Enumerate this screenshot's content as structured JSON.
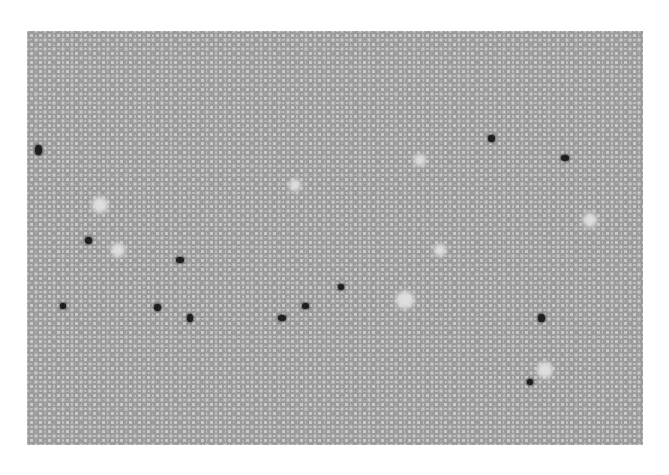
{
  "image": {
    "subject": "grayscale blood smear micrograph",
    "background": "#ffffff",
    "cell_color": "#9a9a9a",
    "dark_cells": [
      {
        "x": 38,
        "y": 150,
        "w": 7,
        "h": 10
      },
      {
        "x": 88,
        "y": 240,
        "w": 7,
        "h": 7
      },
      {
        "x": 180,
        "y": 260,
        "w": 8,
        "h": 6
      },
      {
        "x": 63,
        "y": 306,
        "w": 6,
        "h": 6
      },
      {
        "x": 157,
        "y": 307,
        "w": 7,
        "h": 7
      },
      {
        "x": 190,
        "y": 318,
        "w": 6,
        "h": 8
      },
      {
        "x": 282,
        "y": 318,
        "w": 8,
        "h": 6
      },
      {
        "x": 305,
        "y": 306,
        "w": 7,
        "h": 6
      },
      {
        "x": 341,
        "y": 287,
        "w": 6,
        "h": 6
      },
      {
        "x": 491,
        "y": 138,
        "w": 7,
        "h": 7
      },
      {
        "x": 565,
        "y": 158,
        "w": 8,
        "h": 6
      },
      {
        "x": 541,
        "y": 318,
        "w": 7,
        "h": 8
      },
      {
        "x": 530,
        "y": 382,
        "w": 6,
        "h": 6
      }
    ],
    "clearings": [
      {
        "x": 100,
        "y": 205,
        "r": 8
      },
      {
        "x": 118,
        "y": 250,
        "r": 7
      },
      {
        "x": 295,
        "y": 185,
        "r": 6
      },
      {
        "x": 405,
        "y": 300,
        "r": 9
      },
      {
        "x": 440,
        "y": 250,
        "r": 6
      },
      {
        "x": 590,
        "y": 220,
        "r": 7
      },
      {
        "x": 545,
        "y": 370,
        "r": 8
      },
      {
        "x": 420,
        "y": 160,
        "r": 6
      }
    ]
  }
}
